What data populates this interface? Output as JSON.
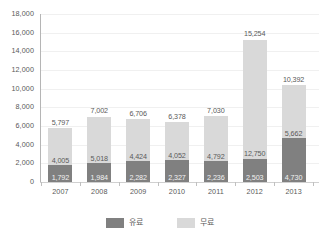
{
  "chart_data": {
    "type": "bar",
    "subtype": "stacked-column",
    "title": "",
    "xlabel": "",
    "ylabel": "",
    "categories": [
      "2007",
      "2008",
      "2009",
      "2010",
      "2011",
      "2012",
      "2013"
    ],
    "series": [
      {
        "name": "유료",
        "color": "#808080",
        "values": [
          1792,
          1984,
          2282,
          2327,
          2236,
          2503,
          4730
        ],
        "labels": [
          "1,792",
          "1,984",
          "2,282",
          "2,327",
          "2,236",
          "2,503",
          "4,730"
        ]
      },
      {
        "name": "무료",
        "color": "#d9d9d9",
        "values": [
          4005,
          5018,
          4424,
          4052,
          4792,
          12750,
          5662
        ],
        "labels": [
          "4,005",
          "5,018",
          "4,424",
          "4,052",
          "4,792",
          "12,750",
          "5,662"
        ]
      }
    ],
    "totals": [
      5797,
      7002,
      6706,
      6378,
      7030,
      15254,
      10392
    ],
    "total_labels": [
      "5,797",
      "7,002",
      "6,706",
      "6,378",
      "7,030",
      "15,254",
      "10,392"
    ],
    "ylim": [
      0,
      18000
    ],
    "yticks": [
      0,
      2000,
      4000,
      6000,
      8000,
      10000,
      12000,
      14000,
      16000,
      18000
    ],
    "ytick_labels": [
      "0",
      "2,000",
      "4,000",
      "6,000",
      "8,000",
      "10,000",
      "12,000",
      "14,000",
      "16,000",
      "18,000"
    ],
    "grid": true,
    "legend_position": "bottom"
  },
  "legend": {
    "items": [
      {
        "label": "유료",
        "color": "#808080"
      },
      {
        "label": "무료",
        "color": "#d9d9d9"
      }
    ]
  },
  "colors": {
    "paid": "#808080",
    "free": "#d9d9d9",
    "gridline": "#f0f0f0",
    "axis": "#b5b5b5",
    "text": "#595959",
    "background": "#ffffff"
  }
}
